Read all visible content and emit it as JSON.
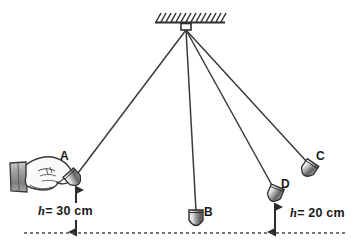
{
  "figure": {
    "background_color": "#ffffff",
    "ink_color": "#333333",
    "line_color": "#3a3a3a"
  },
  "support": {
    "name": "ceiling-support",
    "hatching_count": 13,
    "pivot_x": 186,
    "pivot_y": 28
  },
  "strings": [
    {
      "id": "string-a",
      "to": "A",
      "x2": 75,
      "y2": 176
    },
    {
      "id": "string-b",
      "to": "B",
      "x2": 196,
      "y2": 210
    },
    {
      "id": "string-c",
      "to": "C",
      "x2": 308,
      "y2": 162
    },
    {
      "id": "string-d",
      "to": "D",
      "x2": 272,
      "y2": 186
    }
  ],
  "bobs": [
    {
      "id": "bob-a",
      "label": "A",
      "label_x": 61,
      "label_y": 152,
      "cx": 75,
      "cy": 180,
      "angle": -40
    },
    {
      "id": "bob-b",
      "label": "B",
      "label_x": 205,
      "label_y": 209,
      "cx": 196,
      "cy": 219,
      "angle": 0
    },
    {
      "id": "bob-c",
      "label": "C",
      "label_x": 316,
      "label_y": 152,
      "cx": 310,
      "cy": 170,
      "angle": 35
    },
    {
      "id": "bob-d",
      "label": "D",
      "label_x": 281,
      "label_y": 180,
      "cx": 274,
      "cy": 196,
      "angle": 20
    }
  ],
  "measurements": [
    {
      "id": "height-a",
      "h_symbol": "h",
      "text": "= 30 cm",
      "full_text": "h = 30 cm",
      "value": 30,
      "unit": "cm",
      "label_x": 38,
      "label_y": 206,
      "arrow_x": 76,
      "arrow_top": 188,
      "arrow_bottom": 232
    },
    {
      "id": "height-d",
      "h_symbol": "h",
      "text": "= 20 cm",
      "full_text": "h = 20 cm",
      "value": 20,
      "unit": "cm",
      "label_x": 290,
      "label_y": 208,
      "arrow_x": 275,
      "arrow_top": 208,
      "arrow_bottom": 232
    }
  ],
  "baseline": {
    "name": "lowest-point-reference-line",
    "style": "dashed",
    "x1": 24,
    "x2": 346,
    "y": 233
  },
  "hand": {
    "name": "hand-holding-bob-a",
    "description": "hand gripping pendulum bob A",
    "sleeve_color": "#9b9b9b"
  }
}
